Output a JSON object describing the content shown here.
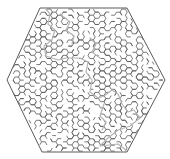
{
  "puzzle": {
    "type": "hexagonal-maze",
    "wall_color": "#5a5a5a",
    "solution_color": "#b4b4b4",
    "background": "#ffffff",
    "outline": [
      [
        40,
        8
      ],
      [
        127,
        8
      ],
      [
        165,
        80
      ],
      [
        127,
        152
      ],
      [
        42,
        152
      ],
      [
        7,
        80
      ]
    ],
    "solution_path": [
      [
        45,
        8
      ],
      [
        50,
        14
      ],
      [
        48,
        24
      ],
      [
        55,
        30
      ],
      [
        52,
        40
      ],
      [
        44,
        46
      ],
      [
        46,
        56
      ],
      [
        58,
        60
      ],
      [
        66,
        58
      ],
      [
        80,
        58
      ],
      [
        88,
        62
      ],
      [
        86,
        72
      ],
      [
        92,
        80
      ],
      [
        90,
        92
      ],
      [
        98,
        98
      ],
      [
        104,
        96
      ],
      [
        112,
        90
      ],
      [
        118,
        94
      ],
      [
        122,
        104
      ],
      [
        128,
        112
      ],
      [
        134,
        110
      ],
      [
        140,
        118
      ],
      [
        130,
        126
      ],
      [
        118,
        130
      ],
      [
        108,
        138
      ],
      [
        100,
        146
      ],
      [
        118,
        144
      ],
      [
        126,
        150
      ]
    ],
    "secondary_paths": [
      [
        [
          60,
          14
        ],
        [
          70,
          22
        ],
        [
          66,
          30
        ],
        [
          74,
          36
        ],
        [
          72,
          44
        ]
      ],
      [
        [
          90,
          38
        ],
        [
          96,
          44
        ],
        [
          92,
          52
        ],
        [
          100,
          58
        ]
      ],
      [
        [
          104,
          104
        ],
        [
          100,
          116
        ],
        [
          106,
          122
        ],
        [
          102,
          130
        ]
      ]
    ]
  }
}
